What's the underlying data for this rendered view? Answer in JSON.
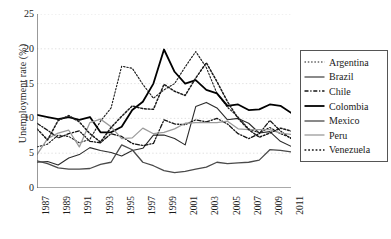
{
  "chart_data": {
    "type": "line",
    "title": "",
    "xlabel": "",
    "ylabel": "Unemployment rate (%)",
    "ylim": [
      0,
      25
    ],
    "yticks": [
      0,
      5,
      10,
      15,
      20,
      25
    ],
    "xlim": [
      1987,
      2011
    ],
    "x": [
      1987,
      1988,
      1989,
      1990,
      1991,
      1992,
      1993,
      1994,
      1995,
      1996,
      1997,
      1998,
      1999,
      2000,
      2001,
      2002,
      2003,
      2004,
      2005,
      2006,
      2007,
      2008,
      2009,
      2010,
      2011
    ],
    "xticks_labeled": [
      "1987",
      "1989",
      "1991",
      "1993",
      "1995",
      "1997",
      "1999",
      "2001",
      "2003",
      "2005",
      "2007",
      "2009",
      "2011"
    ],
    "grid": "horizontal-dotted",
    "legend_position": "right-outside",
    "series": [
      {
        "name": "Argentina",
        "style": "dotted",
        "color": "#1a1a1a",
        "values": [
          5.9,
          6.3,
          7.6,
          7.4,
          6.5,
          7.0,
          9.6,
          11.5,
          17.5,
          17.2,
          14.9,
          12.9,
          14.1,
          15.0,
          17.4,
          19.6,
          17.3,
          13.6,
          11.6,
          10.2,
          8.5,
          7.9,
          8.7,
          7.8,
          7.2
        ]
      },
      {
        "name": "Brazil",
        "style": "solid-thin",
        "color": "#2b2b2b",
        "values": [
          3.7,
          3.8,
          3.3,
          4.3,
          4.8,
          5.8,
          5.4,
          5.1,
          4.6,
          5.4,
          5.7,
          7.6,
          7.6,
          7.1,
          6.2,
          11.7,
          12.3,
          11.5,
          9.8,
          10.0,
          9.3,
          7.9,
          8.1,
          6.7,
          6.0
        ]
      },
      {
        "name": "Chile",
        "style": "dash-dot",
        "color": "#141414",
        "values": [
          9.3,
          8.3,
          7.2,
          7.8,
          8.2,
          6.7,
          6.5,
          7.8,
          7.4,
          6.4,
          6.1,
          6.4,
          9.8,
          9.2,
          9.1,
          9.8,
          9.5,
          10.0,
          9.2,
          7.8,
          7.1,
          7.8,
          9.7,
          8.2,
          7.1
        ]
      },
      {
        "name": "Colombia",
        "style": "solid-bold",
        "color": "#000000",
        "values": [
          10.5,
          10.2,
          9.9,
          10.2,
          9.8,
          10.2,
          8.0,
          8.0,
          8.8,
          11.2,
          12.4,
          15.0,
          19.9,
          16.7,
          15.0,
          15.5,
          14.1,
          13.6,
          11.8,
          12.0,
          11.2,
          11.3,
          12.0,
          11.8,
          10.8
        ]
      },
      {
        "name": "Mexico",
        "style": "solid-gray-dark",
        "color": "#4a4a4a",
        "values": [
          3.9,
          3.5,
          2.9,
          2.7,
          2.7,
          2.8,
          3.4,
          3.7,
          6.2,
          5.5,
          3.7,
          3.2,
          2.5,
          2.2,
          2.4,
          2.7,
          3.0,
          3.7,
          3.5,
          3.6,
          3.7,
          4.0,
          5.5,
          5.4,
          5.2
        ]
      },
      {
        "name": "Peru",
        "style": "solid-gray-light",
        "color": "#9b9b9b",
        "values": [
          4.8,
          7.1,
          7.9,
          8.3,
          5.9,
          9.4,
          9.9,
          8.8,
          7.1,
          7.2,
          8.6,
          7.8,
          8.0,
          8.5,
          9.3,
          9.4,
          9.4,
          9.4,
          9.6,
          8.5,
          8.4,
          8.4,
          8.4,
          7.9,
          7.7
        ]
      },
      {
        "name": "Venezuela",
        "style": "dotted-bold",
        "color": "#1a1a1a",
        "values": [
          8.5,
          6.9,
          9.7,
          10.4,
          9.5,
          7.8,
          6.6,
          8.7,
          10.3,
          11.8,
          11.4,
          11.3,
          14.9,
          13.9,
          13.3,
          15.8,
          18.0,
          15.3,
          12.4,
          10.0,
          8.4,
          7.3,
          7.9,
          8.6,
          8.2
        ]
      }
    ]
  },
  "legend": {
    "items": [
      {
        "label": "Argentina"
      },
      {
        "label": "Brazil"
      },
      {
        "label": "Chile"
      },
      {
        "label": "Colombia"
      },
      {
        "label": "Mexico"
      },
      {
        "label": "Peru"
      },
      {
        "label": "Venezuela"
      }
    ]
  }
}
